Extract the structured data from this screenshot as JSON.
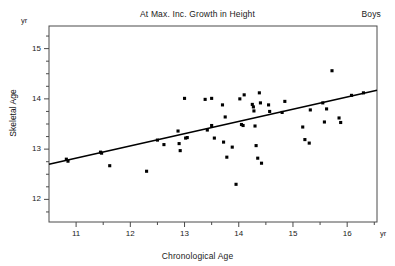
{
  "chart_data": {
    "type": "scatter",
    "title": "At Max. Inc. Growth in Height",
    "group_label": "Boys",
    "xlabel": "Chronological Age",
    "ylabel": "Skeletal Age",
    "x_unit": "yr",
    "y_unit": "yr",
    "xlim": [
      10.5,
      16.55
    ],
    "ylim": [
      11.55,
      15.45
    ],
    "xticks": [
      11,
      12,
      13,
      14,
      15,
      16
    ],
    "xticklabels": [
      "11",
      "12",
      "13",
      "14",
      "15",
      "16"
    ],
    "xminorticks": [
      11.5,
      12.5,
      13.5,
      14.5,
      15.5,
      16.5
    ],
    "yticks": [
      12,
      13,
      14,
      15
    ],
    "yticklabels": [
      "12",
      "13",
      "14",
      "15"
    ],
    "yminorticks": [
      11.75,
      12.25,
      12.5,
      12.75,
      13.25,
      13.5,
      13.75,
      14.25,
      14.5,
      14.75,
      15.25
    ],
    "grid": false,
    "legend": "none",
    "marker": "filled-square",
    "points": [
      [
        10.82,
        12.8
      ],
      [
        10.85,
        12.76
      ],
      [
        11.45,
        12.94
      ],
      [
        11.47,
        12.92
      ],
      [
        11.62,
        12.67
      ],
      [
        12.3,
        12.56
      ],
      [
        12.5,
        13.18
      ],
      [
        12.62,
        13.09
      ],
      [
        12.88,
        13.36
      ],
      [
        12.9,
        13.11
      ],
      [
        12.92,
        12.97
      ],
      [
        13.0,
        14.01
      ],
      [
        13.02,
        13.22
      ],
      [
        13.05,
        13.23
      ],
      [
        13.38,
        13.99
      ],
      [
        13.42,
        13.38
      ],
      [
        13.5,
        14.01
      ],
      [
        13.5,
        13.47
      ],
      [
        13.55,
        13.22
      ],
      [
        13.7,
        13.88
      ],
      [
        13.72,
        13.14
      ],
      [
        13.75,
        13.64
      ],
      [
        13.78,
        12.84
      ],
      [
        13.88,
        13.04
      ],
      [
        13.95,
        12.3
      ],
      [
        14.02,
        14.0
      ],
      [
        14.05,
        13.49
      ],
      [
        14.08,
        13.47
      ],
      [
        14.1,
        14.08
      ],
      [
        14.25,
        13.89
      ],
      [
        14.27,
        13.84
      ],
      [
        14.28,
        13.76
      ],
      [
        14.3,
        13.46
      ],
      [
        14.32,
        13.07
      ],
      [
        14.35,
        12.82
      ],
      [
        14.38,
        14.12
      ],
      [
        14.4,
        13.92
      ],
      [
        14.42,
        12.72
      ],
      [
        14.55,
        13.88
      ],
      [
        14.57,
        13.75
      ],
      [
        14.8,
        13.73
      ],
      [
        14.85,
        13.95
      ],
      [
        15.18,
        13.44
      ],
      [
        15.22,
        13.19
      ],
      [
        15.3,
        13.12
      ],
      [
        15.32,
        13.78
      ],
      [
        15.55,
        13.92
      ],
      [
        15.58,
        13.54
      ],
      [
        15.62,
        13.8
      ],
      [
        15.72,
        14.56
      ],
      [
        15.85,
        13.62
      ],
      [
        15.88,
        13.53
      ],
      [
        16.08,
        14.07
      ],
      [
        16.3,
        14.12
      ]
    ],
    "regression_line": {
      "x_start": 10.5,
      "y_start": 12.7,
      "x_end": 16.55,
      "y_end": 14.17
    }
  }
}
